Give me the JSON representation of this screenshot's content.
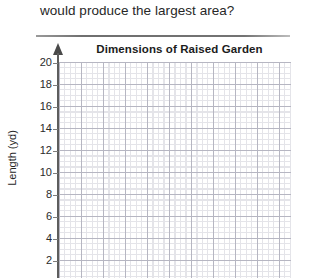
{
  "question": {
    "text": "would produce the largest area?"
  },
  "chart_data": {
    "type": "line",
    "title": "Dimensions of Raised Garden",
    "xlabel": "",
    "ylabel": "Length (yd)",
    "yticks": [
      20,
      18,
      16,
      14,
      12,
      10,
      8,
      6,
      4,
      2
    ],
    "ytick_labels": [
      "20",
      "18",
      "16",
      "14",
      "12",
      "10",
      "8",
      "6",
      "4",
      "2"
    ],
    "ylim": [
      0,
      21
    ],
    "xticks": [],
    "xtick_labels": [],
    "grid": true,
    "grid_style": "graph-paper",
    "legend": null,
    "series": [],
    "values": [],
    "categories": [],
    "annotations": []
  },
  "axis": {
    "y_title": "Length (yd)",
    "arrow_icon": "up-arrow-icon"
  },
  "colors": {
    "text": "#272727",
    "title": "#1c1c1c",
    "axis_line": "#5d5d5d",
    "grid_minor": "#c9c9d4",
    "grid_major": "#a6a6b4",
    "divider": "#737373",
    "background": "#ffffff"
  }
}
